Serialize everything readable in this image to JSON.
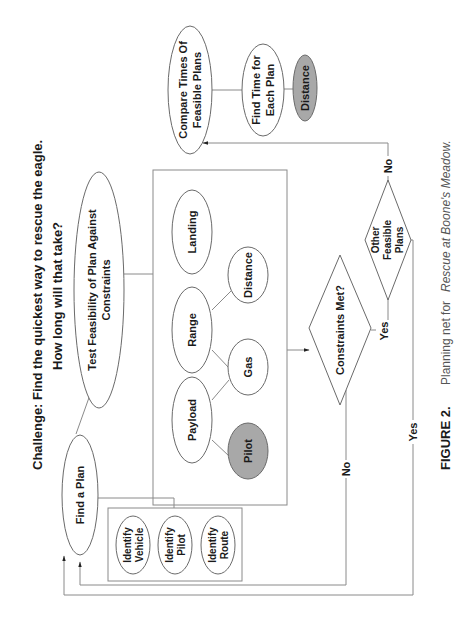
{
  "title": {
    "line1": "Challenge: Find the quickest way to rescue the eagle.",
    "line2": "How long will that take?"
  },
  "nodes": {
    "find_plan": "Find a Plan",
    "test_feasibility": {
      "line1": "Test Feasibility of Plan Against",
      "line2": "Constraints"
    },
    "identify_vehicle": {
      "line1": "Identify",
      "line2": "Vehicle"
    },
    "identify_pilot": {
      "line1": "Identify",
      "line2": "Pilot"
    },
    "identify_route": {
      "line1": "Identify",
      "line2": "Route"
    },
    "landing": "Landing",
    "range": "Range",
    "payload": "Payload",
    "distance": "Distance",
    "gas": "Gas",
    "pilot": "Pilot",
    "constraints_met": "Constraints Met?",
    "other_feasible": {
      "line1": "Other",
      "line2": "Feasible",
      "line3": "Plans"
    },
    "compare_times": {
      "line1": "Compare Times Of",
      "line2": "Feasible Plans"
    },
    "find_time": {
      "line1": "Find Time for",
      "line2": "Each Plan"
    },
    "distance_shaded": "Distance"
  },
  "edge_labels": {
    "constraints_no": "No",
    "constraints_yes": "Yes",
    "other_no": "No",
    "other_yes": "Yes"
  },
  "caption": {
    "figure": "FIGURE 2.",
    "text_prefix": "Planning net for ",
    "text_italic": "Rescue at Boone's Meadow."
  },
  "colors": {
    "shaded_node": "#a8a8a8",
    "line": "#8a8a8a",
    "text": "#1a1a1a"
  }
}
